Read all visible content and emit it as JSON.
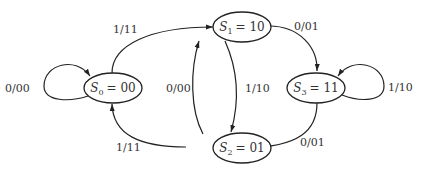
{
  "diagram": {
    "type": "state-machine",
    "colors": {
      "stroke": "#222222",
      "text": "#333333",
      "background": "#ffffff"
    },
    "states": [
      {
        "id": "S0",
        "name": "S",
        "sub": "0",
        "code": "= 00"
      },
      {
        "id": "S1",
        "name": "S",
        "sub": "1",
        "code": "= 10"
      },
      {
        "id": "S2",
        "name": "S",
        "sub": "2",
        "code": "= 01"
      },
      {
        "id": "S3",
        "name": "S",
        "sub": "3",
        "code": "= 11"
      }
    ],
    "transitions": [
      {
        "from": "S0",
        "to": "S0",
        "label": "0/00"
      },
      {
        "from": "S0",
        "to": "S1",
        "label": "1/11"
      },
      {
        "from": "S1",
        "to": "S3",
        "label": "0/01"
      },
      {
        "from": "S1",
        "to": "S2",
        "label": "1/10"
      },
      {
        "from": "S2",
        "to": "S1",
        "label": "0/00"
      },
      {
        "from": "S2",
        "to": "S0",
        "label": "1/11"
      },
      {
        "from": "S3",
        "to": "S3",
        "label": "1/10"
      },
      {
        "from": "S3",
        "to": "S2",
        "label": "0/01"
      }
    ]
  }
}
